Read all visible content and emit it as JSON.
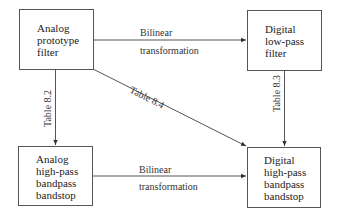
{
  "diagram": {
    "nodes": {
      "analog_prototype": {
        "lines": [
          "Analog",
          "prototype",
          "filter"
        ]
      },
      "digital_lowpass": {
        "lines": [
          "Digital",
          "low-pass",
          "filter"
        ]
      },
      "analog_highpass": {
        "lines": [
          "Analog",
          "high-pass",
          "bandpass",
          "bandstop"
        ]
      },
      "digital_highpass": {
        "lines": [
          "Digital",
          "high-pass",
          "bandpass",
          "bandstop"
        ]
      }
    },
    "edges": {
      "top": {
        "from": "analog_prototype",
        "to": "digital_lowpass",
        "label_above": "Bilinear",
        "label_below": "transformation"
      },
      "bottom": {
        "from": "analog_highpass",
        "to": "digital_highpass",
        "label_above": "Bilinear",
        "label_below": "transformation"
      },
      "left": {
        "from": "analog_prototype",
        "to": "analog_highpass",
        "label": "Table 8.2"
      },
      "right": {
        "from": "digital_lowpass",
        "to": "digital_highpass",
        "label": "Table 8.3"
      },
      "diagonal": {
        "from": "analog_prototype",
        "to": "digital_highpass",
        "label": "Table 8.4"
      }
    },
    "colors": {
      "line": "#555555",
      "text": "#222222"
    }
  }
}
